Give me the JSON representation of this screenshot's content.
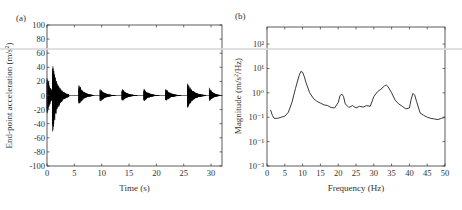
{
  "chart_data": [
    {
      "panel": "(a)",
      "type": "line",
      "title": "",
      "xlabel": "Time (s)",
      "ylabel": "End-point acceleration (m/s²)",
      "xlim": [
        0,
        32
      ],
      "ylim": [
        -100,
        100
      ],
      "xticks": [
        0,
        5,
        10,
        15,
        20,
        25,
        30
      ],
      "yticks": [
        100,
        80,
        60,
        40,
        20,
        0,
        -20,
        -40,
        -60,
        -80,
        -100
      ],
      "grid": false,
      "description": "Repeated decaying oscillation bursts (vibration envelope)",
      "bursts": [
        {
          "t_start": 0.0,
          "peak_pos": 32,
          "peak_neg": -30,
          "decay_to": 2.0
        },
        {
          "t_start": 1.0,
          "peak_pos": 47,
          "peak_neg": -55,
          "decay_to": 4.0
        },
        {
          "t_start": 5.8,
          "peak_pos": 17,
          "peak_neg": -15,
          "decay_to": 8.5
        },
        {
          "t_start": 9.7,
          "peak_pos": 10,
          "peak_neg": -10,
          "decay_to": 12.5
        },
        {
          "t_start": 13.7,
          "peak_pos": 10,
          "peak_neg": -9,
          "decay_to": 16.5
        },
        {
          "t_start": 17.7,
          "peak_pos": 10,
          "peak_neg": -9,
          "decay_to": 20.5
        },
        {
          "t_start": 21.7,
          "peak_pos": 10,
          "peak_neg": -9,
          "decay_to": 24.5
        },
        {
          "t_start": 25.7,
          "peak_pos": 18,
          "peak_neg": -18,
          "decay_to": 29.0
        },
        {
          "t_start": 29.7,
          "peak_pos": 11,
          "peak_neg": -9,
          "decay_to": 32.0
        }
      ]
    },
    {
      "panel": "(b)",
      "type": "line",
      "title": "",
      "xlabel": "Frequency (Hz)",
      "ylabel": "Magnitude (m/s²/Hz)",
      "xlim": [
        0,
        50
      ],
      "ylim": [
        0.001,
        500
      ],
      "yscale": "log",
      "xticks": [
        0,
        5,
        10,
        15,
        20,
        25,
        30,
        35,
        40,
        45,
        50
      ],
      "ytick_labels": [
        "10²",
        "10¹",
        "10⁰",
        "10⁻¹",
        "10⁻¹",
        "10⁻³"
      ],
      "yticks": [
        100,
        10,
        1,
        0.1,
        0.01,
        0.001
      ],
      "grid": false,
      "x": [
        1,
        1.5,
        2,
        3,
        4,
        5,
        6,
        7,
        8,
        9,
        9.5,
        10,
        10.5,
        11,
        12,
        13,
        14,
        15,
        16,
        17,
        18,
        19,
        20,
        20.5,
        21,
        21.5,
        22,
        23,
        24,
        25,
        26,
        27,
        28,
        29,
        30,
        31,
        32,
        33,
        33.5,
        34,
        35,
        36,
        37,
        38,
        39,
        40,
        40.5,
        41,
        41.5,
        42,
        43,
        44,
        45,
        46,
        47,
        48,
        49,
        50
      ],
      "y": [
        0.2,
        0.12,
        0.09,
        0.09,
        0.1,
        0.11,
        0.16,
        0.4,
        1.5,
        5.0,
        7.5,
        7.0,
        4.5,
        2.5,
        1.0,
        0.6,
        0.45,
        0.38,
        0.32,
        0.3,
        0.25,
        0.24,
        0.4,
        0.75,
        0.9,
        0.7,
        0.35,
        0.25,
        0.3,
        0.24,
        0.28,
        0.26,
        0.3,
        0.28,
        0.7,
        1.1,
        1.4,
        1.9,
        2.1,
        1.8,
        1.0,
        0.5,
        0.35,
        0.28,
        0.22,
        0.24,
        0.55,
        0.95,
        0.8,
        0.45,
        0.15,
        0.12,
        0.1,
        0.09,
        0.085,
        0.08,
        0.09,
        0.1
      ]
    }
  ],
  "panels": {
    "a": {
      "label": "(a)",
      "xlabel": "Time (s)",
      "ylabel_main": "End-point acceleration (m/s",
      "ylabel_sup": "2",
      "ylabel_end": ")"
    },
    "b": {
      "label": "(b)",
      "xlabel": "Frequency (Hz)",
      "ylabel_main": "Magnitude (m/s",
      "ylabel_sup": "2",
      "ylabel_end": "/Hz)"
    }
  }
}
